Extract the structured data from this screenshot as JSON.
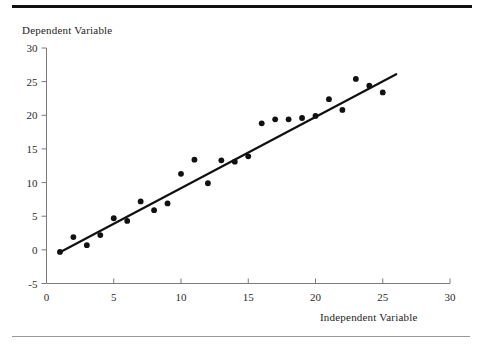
{
  "figure": {
    "background_color": "#ffffff",
    "top_rule_color": "#111111",
    "bottom_rule_color": "#999999",
    "axis_color": "#7a7a7a",
    "marker_color": "#111111",
    "line_color": "#111111"
  },
  "chart_data": {
    "type": "scatter",
    "title": "",
    "subtitle": "",
    "xlabel": "Independent Variable",
    "ylabel": "Dependent Variable",
    "xlim": [
      0,
      30
    ],
    "ylim": [
      -5,
      30
    ],
    "xticks": [
      0,
      5,
      10,
      15,
      20,
      25,
      30
    ],
    "xtick_labels": [
      "0",
      "5",
      "10",
      "15",
      "20",
      "25",
      "30"
    ],
    "yticks": [
      -5,
      0,
      5,
      10,
      15,
      20,
      25,
      30
    ],
    "ytick_labels": [
      "-5",
      "0",
      "5",
      "10",
      "15",
      "20",
      "25",
      "30"
    ],
    "grid": false,
    "legend": null,
    "legend_position": "none",
    "annotations": [],
    "marker_shape": "circle",
    "marker_size_px": 5,
    "x": [
      1,
      2,
      3,
      4,
      5,
      6,
      7,
      8,
      9,
      10,
      11,
      12,
      13,
      14,
      15,
      16,
      17,
      18,
      19,
      20,
      21,
      22,
      23,
      24,
      25
    ],
    "y": [
      -0.3,
      1.9,
      0.7,
      2.2,
      4.7,
      4.3,
      7.2,
      5.9,
      6.9,
      11.3,
      13.4,
      9.9,
      13.3,
      13.1,
      13.9,
      18.8,
      19.4,
      19.4,
      19.6,
      19.9,
      22.4,
      20.8,
      25.4,
      24.4,
      23.4
    ],
    "series": [
      {
        "name": "observations",
        "type": "scatter",
        "x": [
          1,
          2,
          3,
          4,
          5,
          6,
          7,
          8,
          9,
          10,
          11,
          12,
          13,
          14,
          15,
          16,
          17,
          18,
          19,
          20,
          21,
          22,
          23,
          24,
          25
        ],
        "values": [
          -0.3,
          1.9,
          0.7,
          2.2,
          4.7,
          4.3,
          7.2,
          5.9,
          6.9,
          11.3,
          13.4,
          9.9,
          13.3,
          13.1,
          13.9,
          18.8,
          19.4,
          19.4,
          19.6,
          19.9,
          22.4,
          20.8,
          25.4,
          24.4,
          23.4
        ]
      },
      {
        "name": "fitted-regression-line",
        "type": "line",
        "x": [
          1,
          26
        ],
        "values": [
          -0.35,
          26.1
        ],
        "slope": 1.058,
        "intercept": -1.41
      }
    ]
  }
}
